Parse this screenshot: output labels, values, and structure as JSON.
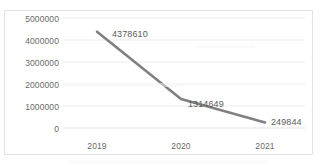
{
  "chart_data": {
    "type": "line",
    "title": "",
    "subtitle": "",
    "xlabel": "",
    "ylabel": "",
    "categories": [
      "2019",
      "2020",
      "2021"
    ],
    "values": [
      4378610,
      1314649,
      249844
    ],
    "series": [
      {
        "name": "",
        "values": [
          4378610,
          1314649,
          249844
        ],
        "color": "#808080"
      }
    ],
    "data_labels": [
      "4378610",
      "1314649",
      "249844"
    ],
    "ylim": [
      0,
      5000000
    ],
    "y_ticks": [
      0,
      1000000,
      2000000,
      3000000,
      4000000,
      5000000
    ],
    "y_tick_labels": [
      "0",
      "1000000",
      "2000000",
      "3000000",
      "4000000",
      "5000000"
    ],
    "x_tick_labels": [
      "2019",
      "2020",
      "2021"
    ],
    "grid": true,
    "grid_axis": "y",
    "grid_color": "#ededed",
    "legend": false,
    "legend_position": "none",
    "plot_border": "#e3e3e3",
    "background": "#ffffff",
    "markers": false,
    "line_width": 2.6,
    "annotations": []
  },
  "axis": {
    "y_labels": [
      "5000000",
      "4000000",
      "3000000",
      "2000000",
      "1000000",
      "0"
    ],
    "x_labels": [
      "2019",
      "2020",
      "2021"
    ]
  },
  "labels": {
    "point_2019": "4378610",
    "point_2020": "1314649",
    "point_2021": "249844"
  },
  "colors": {
    "line": "#808080",
    "grid": "#ededed",
    "border": "#e3e3e3",
    "tick_text": "#6a6a6a",
    "label_text": "#5b5b5b",
    "background": "#ffffff"
  }
}
